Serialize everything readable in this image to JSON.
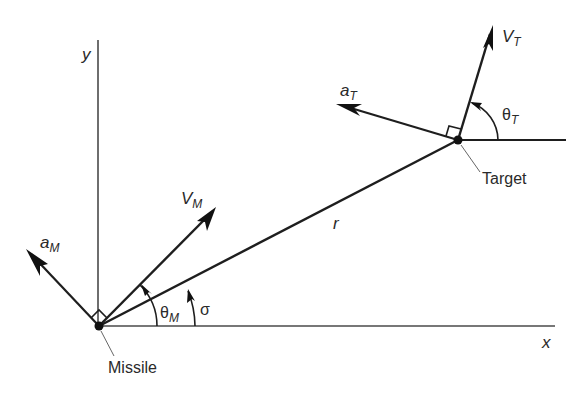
{
  "diagram": {
    "type": "missile-target engagement geometry",
    "axes": {
      "x_label": "x",
      "y_label": "y"
    },
    "missile": {
      "label": "Missile",
      "velocity_label": "V",
      "velocity_sub": "M",
      "accel_label": "a",
      "accel_sub": "M",
      "angle_label": "θ",
      "angle_sub": "M"
    },
    "target": {
      "label": "Target",
      "velocity_label": "V",
      "velocity_sub": "T",
      "accel_label": "a",
      "accel_sub": "T",
      "angle_label": "θ",
      "angle_sub": "T"
    },
    "line_of_sight": {
      "range_label": "r",
      "angle_label": "σ"
    }
  }
}
